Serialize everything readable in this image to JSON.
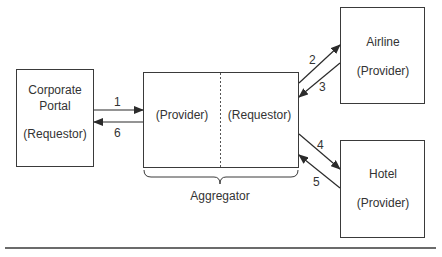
{
  "diagram": {
    "nodes": [
      {
        "id": "portal",
        "title": "Corporate Portal",
        "title_line1": "Corporate",
        "title_line2": "Portal",
        "role": "(Requestor)"
      },
      {
        "id": "aggregator",
        "title": "Aggregator",
        "left_role": "(Provider)",
        "right_role": "(Requestor)"
      },
      {
        "id": "airline",
        "title": "Airline",
        "role": "(Provider)"
      },
      {
        "id": "hotel",
        "title": "Hotel",
        "role": "(Provider)"
      }
    ],
    "edges": [
      {
        "label": "1",
        "from": "portal",
        "to": "aggregator"
      },
      {
        "label": "2",
        "from": "aggregator",
        "to": "airline"
      },
      {
        "label": "3",
        "from": "airline",
        "to": "aggregator"
      },
      {
        "label": "4",
        "from": "aggregator",
        "to": "hotel"
      },
      {
        "label": "5",
        "from": "hotel",
        "to": "aggregator"
      },
      {
        "label": "6",
        "from": "aggregator",
        "to": "portal"
      }
    ],
    "colors": {
      "stroke": "#3a3a3a",
      "background": "#ffffff"
    }
  }
}
